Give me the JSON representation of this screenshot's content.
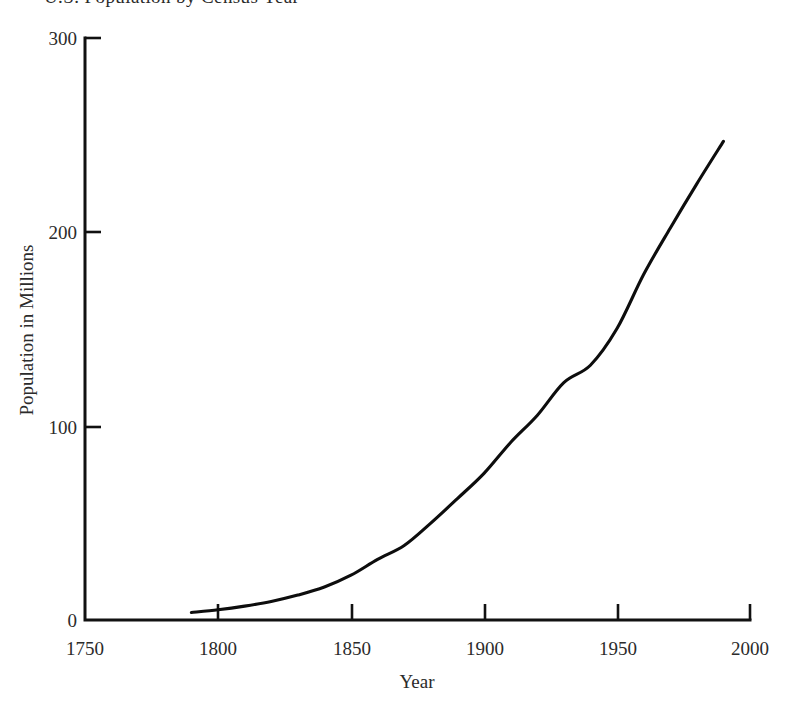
{
  "chart_data": {
    "type": "line",
    "title": "U.S. Population by Census Year",
    "xlabel": "Year",
    "ylabel": "Population in Millions",
    "xlim": [
      1750,
      2000
    ],
    "ylim": [
      0,
      300
    ],
    "xticks": [
      1750,
      1800,
      1850,
      1900,
      1950,
      2000
    ],
    "yticks": [
      0,
      100,
      200,
      300
    ],
    "xtick_labels": [
      "1750",
      "1800",
      "1850",
      "1900",
      "1950",
      "2000"
    ],
    "ytick_labels": [
      "0",
      "100",
      "200",
      "300"
    ],
    "grid": false,
    "legend": false,
    "series": [
      {
        "name": "U.S. Population",
        "x": [
          1790,
          1800,
          1810,
          1820,
          1830,
          1840,
          1850,
          1860,
          1870,
          1880,
          1890,
          1900,
          1910,
          1920,
          1930,
          1940,
          1950,
          1960,
          1970,
          1980,
          1990
        ],
        "values": [
          3.9,
          5.3,
          7.2,
          9.6,
          12.9,
          17.1,
          23.2,
          31.4,
          38.6,
          50.2,
          62.9,
          76.0,
          92.0,
          106.0,
          123.0,
          132.0,
          151.0,
          179.0,
          203.0,
          226.0,
          248.0
        ]
      }
    ]
  },
  "axes": {
    "title_text": "U.S. Population by Census Year",
    "x_axis_label": "Year",
    "y_axis_label": "Population in Millions"
  },
  "colors": {
    "line": "#0d0d0d",
    "axis": "#111111",
    "text": "#2b2b2b",
    "background": "#ffffff"
  }
}
